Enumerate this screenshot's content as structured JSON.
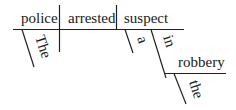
{
  "diagram": {
    "type": "Reed-Kellogg sentence diagram",
    "sentence_words": {
      "subject": "police",
      "verb": "arrested",
      "object": "suspect",
      "subject_modifier": "The",
      "object_modifier": "a",
      "preposition": "in",
      "prep_object": "robbery",
      "prep_object_modifier": "the"
    }
  }
}
